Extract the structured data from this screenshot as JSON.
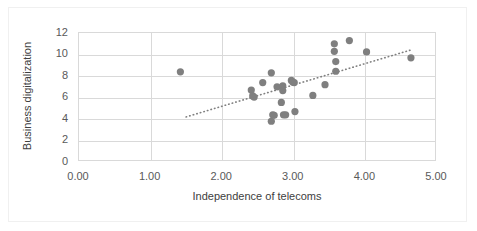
{
  "chart_data": {
    "type": "scatter",
    "title": "",
    "xlabel": "Independence of telecoms",
    "ylabel": "Business digitalization",
    "xlim": [
      0,
      5
    ],
    "ylim": [
      0,
      12
    ],
    "xticks": [
      "0.00",
      "1.00",
      "2.00",
      "3.00",
      "4.00",
      "5.00"
    ],
    "xtick_values": [
      0,
      1,
      2,
      3,
      4,
      5
    ],
    "yticks": [
      "0",
      "2",
      "4",
      "6",
      "8",
      "10",
      "12"
    ],
    "ytick_values": [
      0,
      2,
      4,
      6,
      8,
      10,
      12
    ],
    "grid": "horizontal-and-vertical",
    "legend": "none",
    "marker_color": "#7f7f7f",
    "marker_size": 6,
    "gridline_color": "#d9d9d9",
    "points": [
      {
        "x": 1.43,
        "y": 8.3
      },
      {
        "x": 2.42,
        "y": 6.6
      },
      {
        "x": 2.44,
        "y": 6.05
      },
      {
        "x": 2.46,
        "y": 5.95
      },
      {
        "x": 2.58,
        "y": 7.3
      },
      {
        "x": 2.7,
        "y": 8.2
      },
      {
        "x": 2.7,
        "y": 3.7
      },
      {
        "x": 2.72,
        "y": 4.3
      },
      {
        "x": 2.74,
        "y": 4.25
      },
      {
        "x": 2.78,
        "y": 6.9
      },
      {
        "x": 2.84,
        "y": 5.45
      },
      {
        "x": 2.86,
        "y": 7.0
      },
      {
        "x": 2.86,
        "y": 6.55
      },
      {
        "x": 2.87,
        "y": 4.3
      },
      {
        "x": 2.9,
        "y": 4.3
      },
      {
        "x": 2.98,
        "y": 7.5
      },
      {
        "x": 3.0,
        "y": 7.35
      },
      {
        "x": 3.02,
        "y": 7.3
      },
      {
        "x": 3.03,
        "y": 4.6
      },
      {
        "x": 3.28,
        "y": 6.1
      },
      {
        "x": 3.45,
        "y": 7.1
      },
      {
        "x": 3.58,
        "y": 10.9
      },
      {
        "x": 3.58,
        "y": 10.2
      },
      {
        "x": 3.6,
        "y": 9.25
      },
      {
        "x": 3.6,
        "y": 8.35
      },
      {
        "x": 3.79,
        "y": 11.2
      },
      {
        "x": 4.03,
        "y": 10.15
      },
      {
        "x": 4.65,
        "y": 9.6
      }
    ],
    "trendline": {
      "type": "linear-dotted",
      "x_start": 1.51,
      "y_start": 4.1,
      "x_end": 4.66,
      "y_end": 10.35,
      "color": "#808080",
      "style": "dotted"
    }
  }
}
